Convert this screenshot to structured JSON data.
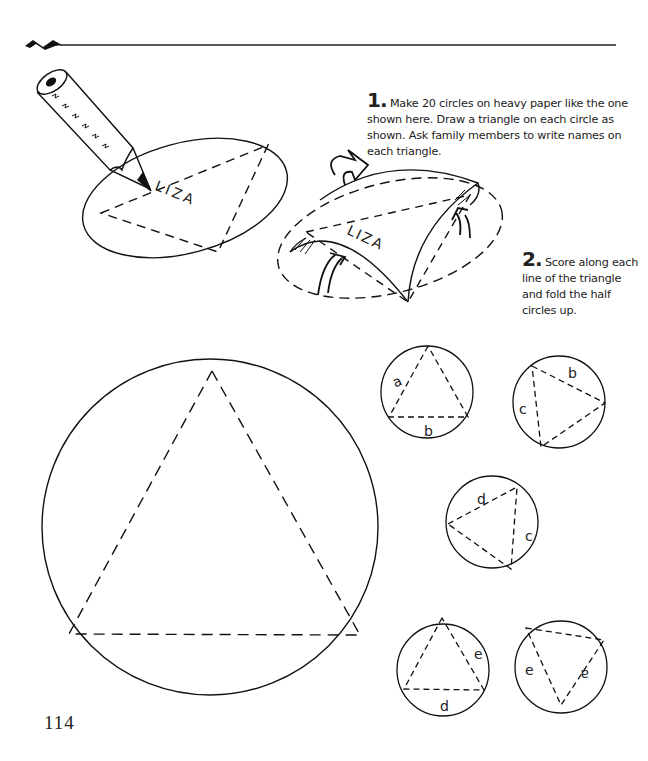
{
  "page": {
    "number": "114"
  },
  "steps": [
    {
      "number": "1.",
      "text": "Make 20 circles on heavy paper like the one shown here. Draw a triangle on each circle as shown. Ask family members to write names on each triangle."
    },
    {
      "number": "2.",
      "text": "Score along each line of the triangle and fold the half circles up."
    }
  ],
  "illustrations": {
    "name_on_circle": "LIZA",
    "template_circle": "large circle with dashed equilateral triangle",
    "small_circles": [
      {
        "labels": [
          "a",
          "b"
        ]
      },
      {
        "labels": [
          "b",
          "c"
        ]
      },
      {
        "labels": [
          "d",
          "c"
        ]
      },
      {
        "labels": [
          "e",
          "d"
        ]
      },
      {
        "labels": [
          "e",
          "a"
        ]
      }
    ]
  },
  "colors": {
    "ink": "#1a1a1a",
    "paper": "#ffffff"
  }
}
